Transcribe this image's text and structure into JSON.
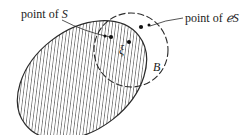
{
  "diagram": {
    "type": "set-boundary-illustration",
    "shapes": {
      "set_S": {
        "kind": "ellipse",
        "fill": "hatched",
        "hatch_color": "#3a3a3a",
        "outline_color": "#2a2a2a"
      },
      "ball_B": {
        "kind": "circle",
        "outline": "dashed",
        "outline_color": "#2a2a2a"
      }
    },
    "labels": {
      "point_of_S_prefix": "point of ",
      "point_of_S_symbol": "S",
      "point_of_CS_prefix": "point of ",
      "point_of_CS_symbol": "ℯS",
      "xi": "ξ",
      "ball": "B"
    },
    "points": [
      {
        "name": "point-of-S",
        "description": "point of S inside B"
      },
      {
        "name": "point-of-complement-S",
        "description": "point of complement of S inside B"
      },
      {
        "name": "xi",
        "description": "boundary point ξ"
      }
    ],
    "colors": {
      "ink": "#1a1a1a",
      "background": "#ffffff"
    }
  }
}
